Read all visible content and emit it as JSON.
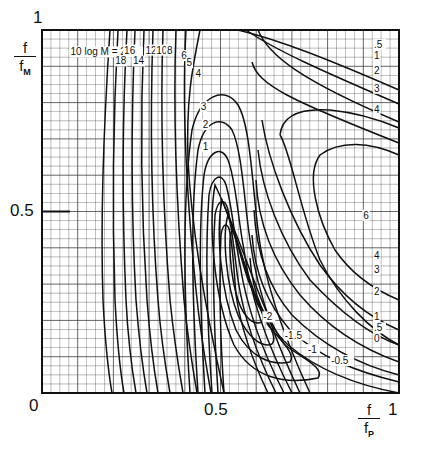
{
  "chart_data": {
    "type": "contour",
    "title": "",
    "xlabel": "f / f_P",
    "ylabel": "f / f_M",
    "xlim": [
      0,
      1
    ],
    "ylim": [
      0,
      1
    ],
    "x_ticks": [
      "0",
      "0.5",
      "1"
    ],
    "y_ticks": [
      "0",
      "0.5",
      "1"
    ],
    "grid": true,
    "grid_spacing": 0.025,
    "legend_text": "10 log M = 20",
    "contour_levels_left_family": [
      20,
      18,
      16,
      14,
      12,
      10,
      8,
      6,
      5,
      4,
      3,
      2,
      1
    ],
    "contour_levels_trough": [
      -2,
      -1.5,
      -1,
      -0.5
    ],
    "contour_levels_right_family": [
      0.5,
      1,
      2,
      3,
      4,
      6
    ],
    "contour_levels_lower_right": [
      6,
      4,
      3,
      2,
      1,
      0.5,
      0
    ],
    "annotations": [
      {
        "text": "10 log M = 20",
        "x": 0.08,
        "y": 0.93
      },
      {
        "text": "18",
        "x": 0.205,
        "y": 0.905
      },
      {
        "text": "16",
        "x": 0.23,
        "y": 0.935
      },
      {
        "text": "14",
        "x": 0.255,
        "y": 0.905
      },
      {
        "text": "12",
        "x": 0.29,
        "y": 0.935
      },
      {
        "text": "10",
        "x": 0.32,
        "y": 0.935
      },
      {
        "text": "8",
        "x": 0.35,
        "y": 0.935
      },
      {
        "text": "6",
        "x": 0.39,
        "y": 0.92
      },
      {
        "text": "5",
        "x": 0.405,
        "y": 0.9
      },
      {
        "text": "4",
        "x": 0.43,
        "y": 0.87
      },
      {
        "text": "3",
        "x": 0.445,
        "y": 0.78
      },
      {
        "text": "2",
        "x": 0.45,
        "y": 0.73
      },
      {
        "text": "1",
        "x": 0.45,
        "y": 0.67
      },
      {
        "text": ".5",
        "x": 0.93,
        "y": 0.95
      },
      {
        "text": "1",
        "x": 0.93,
        "y": 0.92
      },
      {
        "text": "2",
        "x": 0.93,
        "y": 0.88
      },
      {
        "text": "3",
        "x": 0.93,
        "y": 0.83
      },
      {
        "text": "4",
        "x": 0.93,
        "y": 0.77
      },
      {
        "text": "6",
        "x": 0.9,
        "y": 0.48
      },
      {
        "text": "4",
        "x": 0.93,
        "y": 0.37
      },
      {
        "text": "3",
        "x": 0.93,
        "y": 0.33
      },
      {
        "text": "2",
        "x": 0.93,
        "y": 0.27
      },
      {
        "text": "1",
        "x": 0.93,
        "y": 0.2
      },
      {
        "text": ".5",
        "x": 0.93,
        "y": 0.17
      },
      {
        "text": "0",
        "x": 0.93,
        "y": 0.14
      },
      {
        "text": "-2",
        "x": 0.62,
        "y": 0.2
      },
      {
        "text": "-1.5",
        "x": 0.68,
        "y": 0.15
      },
      {
        "text": "-1",
        "x": 0.745,
        "y": 0.11
      },
      {
        "text": "-0.5",
        "x": 0.81,
        "y": 0.08
      }
    ]
  },
  "axes": {
    "y_top_tick": "1",
    "y_mid_tick": "0.5",
    "origin_tick": "0",
    "x_mid_tick": "0.5",
    "x_right_tick": "1",
    "y_label_num": "f",
    "y_label_den": "f",
    "y_label_sub": "M",
    "x_label_num": "f",
    "x_label_den": "f",
    "x_label_sub": "P"
  },
  "colors": {
    "ink": "#111111",
    "grid": "#333333",
    "background": "#ffffff"
  }
}
